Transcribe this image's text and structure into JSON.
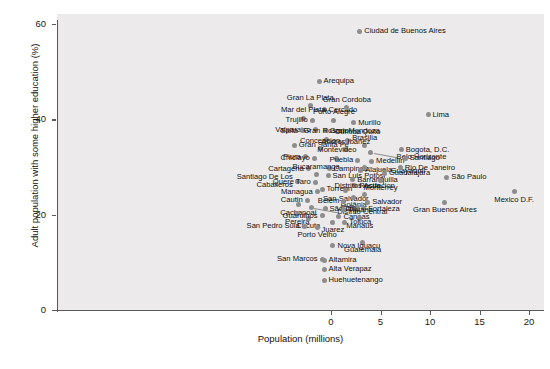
{
  "chart_data": {
    "type": "scatter",
    "title": "",
    "xlabel": "Population (millions)",
    "ylabel": "Adult population with some higher education (%)",
    "xlim": [
      -5.5,
      21.5
    ],
    "ylim": [
      0,
      62
    ],
    "xticks": [
      0,
      5,
      10,
      15,
      20
    ],
    "yticks": [
      0,
      20,
      40,
      60
    ],
    "grid": false,
    "legend": null,
    "marker_color": "#8d8d8d",
    "panel_color": "#eceaea",
    "points": [
      {
        "label": "Ciudad de Buenos Aires",
        "x": 2.9,
        "y": 58.5,
        "side": "r"
      },
      {
        "label": "Arequipa",
        "x": -1.2,
        "y": 48.0,
        "side": "r"
      },
      {
        "label": "Gran La Plata",
        "x": -2.1,
        "y": 42.8,
        "side": "c-top"
      },
      {
        "label": "Cercado",
        "x": -0.7,
        "y": 42.0,
        "side": "r"
      },
      {
        "label": "Gran Cordoba",
        "x": 1.6,
        "y": 42.4,
        "side": "c-top"
      },
      {
        "label": "Mar del Plata",
        "x": -2.8,
        "y": 40.2,
        "side": "c-top"
      },
      {
        "label": "Trujillo",
        "x": -1.9,
        "y": 39.8,
        "side": "l"
      },
      {
        "label": "Porto Alegre",
        "x": 0.3,
        "y": 39.8,
        "side": "c-top"
      },
      {
        "label": "Murillo",
        "x": 2.3,
        "y": 39.3,
        "side": "r"
      },
      {
        "label": "Valparaiso",
        "x": -1.6,
        "y": 37.8,
        "side": "l"
      },
      {
        "label": "Gran Mendoza",
        "x": -0.6,
        "y": 37.6,
        "side": "r"
      },
      {
        "label": "Quito",
        "x": 2.7,
        "y": 37.4,
        "side": "r"
      },
      {
        "label": "Salta",
        "x": -2.9,
        "y": 37.6,
        "side": "l"
      },
      {
        "label": "Gran Rosario",
        "x": -0.5,
        "y": 35.8,
        "side": "c-top"
      },
      {
        "label": "Curitiba",
        "x": 1.7,
        "y": 35.6,
        "side": "c-top"
      },
      {
        "label": "Brasilia",
        "x": 3.4,
        "y": 34.5,
        "side": "c-top"
      },
      {
        "label": "Gran Santa Fe",
        "x": -3.7,
        "y": 34.6,
        "side": "r"
      },
      {
        "label": "Concepcion",
        "x": -1.1,
        "y": 33.8,
        "side": "c-top"
      },
      {
        "label": "Andres Ibañez",
        "x": 1.5,
        "y": 33.6,
        "side": "c-top"
      },
      {
        "label": "Belo Horizonte",
        "x": 4.0,
        "y": 33.0,
        "side": "leader"
      },
      {
        "label": "Piura",
        "x": -2.6,
        "y": 32.2,
        "side": "l"
      },
      {
        "label": "Chiclayo",
        "x": -1.7,
        "y": 31.8,
        "side": "l"
      },
      {
        "label": "Montevideo",
        "x": 0.6,
        "y": 31.8,
        "side": "c-top"
      },
      {
        "label": "Puebla",
        "x": 2.7,
        "y": 31.4,
        "side": "l"
      },
      {
        "label": "Medellin",
        "x": 4.1,
        "y": 31.2,
        "side": "r"
      },
      {
        "label": "Cartagena",
        "x": -2.3,
        "y": 29.6,
        "side": "l"
      },
      {
        "label": "Campinas",
        "x": -0.2,
        "y": 29.6,
        "side": "r"
      },
      {
        "label": "San Luis Potosi",
        "x": -0.3,
        "y": 28.2,
        "side": "r"
      },
      {
        "label": "Bucaramanga",
        "x": -1.5,
        "y": 28.4,
        "side": "c-top"
      },
      {
        "label": "Alajuela",
        "x": 3.0,
        "y": 29.3,
        "side": "r"
      },
      {
        "label": "Guayaquil",
        "x": 3.4,
        "y": 29.9,
        "side": "leader"
      },
      {
        "label": "Guadalajara",
        "x": 5.4,
        "y": 28.7,
        "side": "r"
      },
      {
        "label": "Santiago De Los Caballeros",
        "x": -3.4,
        "y": 27.0,
        "side": "l2"
      },
      {
        "label": "Quere Taro",
        "x": -1.6,
        "y": 26.8,
        "side": "l"
      },
      {
        "label": "Barranquilla",
        "x": 2.2,
        "y": 27.3,
        "side": "r"
      },
      {
        "label": "Monterrey",
        "x": 5.0,
        "y": 27.2,
        "side": "c-bot"
      },
      {
        "label": "Recife",
        "x": 2.4,
        "y": 26.1,
        "side": "r"
      },
      {
        "label": "Torreon",
        "x": -0.9,
        "y": 25.3,
        "side": "r"
      },
      {
        "label": "Managua",
        "x": -1.4,
        "y": 24.8,
        "side": "l"
      },
      {
        "label": "San Salvador",
        "x": 1.5,
        "y": 25.0,
        "side": "c-bot"
      },
      {
        "label": "Distritos Asuncion",
        "x": 3.4,
        "y": 24.3,
        "side": "c-top"
      },
      {
        "label": "Goiânia",
        "x": 2.3,
        "y": 23.7,
        "side": "c-bot"
      },
      {
        "label": "Cautin",
        "x": -2.4,
        "y": 23.0,
        "side": "l"
      },
      {
        "label": "Belem",
        "x": 1.3,
        "y": 22.8,
        "side": "l"
      },
      {
        "label": "Salvador",
        "x": 3.7,
        "y": 22.6,
        "side": "r"
      },
      {
        "label": "Cachapoal",
        "x": -3.3,
        "y": 22.1,
        "side": "c-bot"
      },
      {
        "label": "Distrito Central",
        "x": -2.0,
        "y": 21.4,
        "side": "leader"
      },
      {
        "label": "São Luis",
        "x": -0.6,
        "y": 21.2,
        "side": "r"
      },
      {
        "label": "Cali",
        "x": 2.7,
        "y": 21.4,
        "side": "l"
      },
      {
        "label": "Fortaleza",
        "x": 3.3,
        "y": 21.2,
        "side": "r"
      },
      {
        "label": "Tijuana",
        "x": 1.3,
        "y": 21.0,
        "side": "r"
      },
      {
        "label": "Pereira",
        "x": -3.4,
        "y": 20.2,
        "side": "c-bot"
      },
      {
        "label": "Cucuta",
        "x": -2.3,
        "y": 19.2,
        "side": "c-bot"
      },
      {
        "label": "Guarulhos",
        "x": -0.9,
        "y": 19.8,
        "side": "l"
      },
      {
        "label": "Canoas",
        "x": 0.8,
        "y": 19.6,
        "side": "r"
      },
      {
        "label": "Manaus",
        "x": 2.9,
        "y": 19.2,
        "side": "c-bot"
      },
      {
        "label": "Juarez",
        "x": 0.2,
        "y": 18.4,
        "side": "c-bot"
      },
      {
        "label": "Toluca",
        "x": 1.4,
        "y": 18.4,
        "side": "r"
      },
      {
        "label": "Porto Velho",
        "x": -1.4,
        "y": 17.4,
        "side": "c-bot"
      },
      {
        "label": "San Pedro Sula",
        "x": -2.7,
        "y": 17.6,
        "side": "l"
      },
      {
        "label": "Guatemala",
        "x": 3.2,
        "y": 14.2,
        "side": "c-bot"
      },
      {
        "label": "Nova Iguaçu",
        "x": 0.2,
        "y": 13.5,
        "side": "r"
      },
      {
        "label": "San Marcos",
        "x": -0.9,
        "y": 10.6,
        "side": "l"
      },
      {
        "label": "Altamira",
        "x": -0.7,
        "y": 10.4,
        "side": "r"
      },
      {
        "label": "Alta Verapaz",
        "x": -0.7,
        "y": 8.6,
        "side": "r"
      },
      {
        "label": "Huehuetenango",
        "x": -0.7,
        "y": 6.2,
        "side": "r"
      },
      {
        "label": "Lima",
        "x": 9.8,
        "y": 41.0,
        "side": "r"
      },
      {
        "label": "Bogota, D.C.",
        "x": 7.1,
        "y": 33.6,
        "side": "r"
      },
      {
        "label": "Santiago",
        "x": 7.5,
        "y": 31.8,
        "side": "r"
      },
      {
        "label": "Rio De Janeiro",
        "x": 7.0,
        "y": 29.8,
        "side": "r"
      },
      {
        "label": "São Paulo",
        "x": 11.7,
        "y": 27.8,
        "side": "r"
      },
      {
        "label": "Gran Buenos Aires",
        "x": 11.5,
        "y": 22.6,
        "side": "c-bot"
      },
      {
        "label": "Mexico D.F.",
        "x": 18.5,
        "y": 24.8,
        "side": "c-bot"
      }
    ]
  }
}
